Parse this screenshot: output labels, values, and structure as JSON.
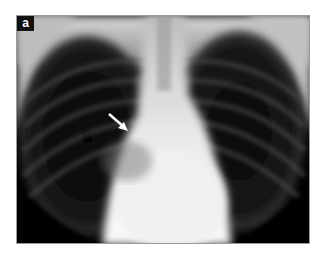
{
  "figure": {
    "panel_label": "a",
    "annotation": {
      "type": "arrow",
      "icon": "arrow-down-right-icon",
      "color": "#ffffff"
    },
    "colors": {
      "background": "#ffffff",
      "frame_border": "#9a9a9a",
      "label_bg": "#111111",
      "label_fg": "#ffffff"
    }
  }
}
